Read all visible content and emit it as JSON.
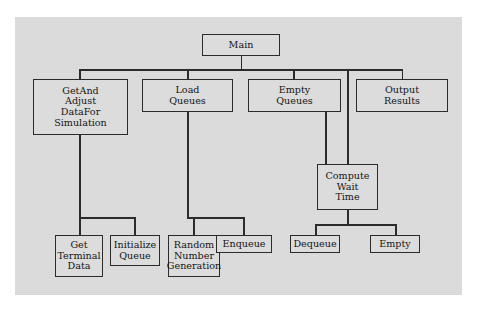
{
  "diagram": {
    "type": "structure-chart",
    "background_color": "#dcdcdc",
    "page_color": "#ffffff",
    "line_color": "#2b2b2b",
    "text_color": "#141414",
    "nodes": [
      {
        "id": "main",
        "lines": [
          "Main"
        ]
      },
      {
        "id": "getandadjust",
        "lines": [
          "GetAnd",
          "Adjust",
          "DataFor",
          "Simulation"
        ]
      },
      {
        "id": "loadqueues",
        "lines": [
          "Load",
          "Queues"
        ]
      },
      {
        "id": "emptyqueues",
        "lines": [
          "Empty",
          "Queues"
        ]
      },
      {
        "id": "outputresults",
        "lines": [
          "Output",
          "Results"
        ]
      },
      {
        "id": "computewait",
        "lines": [
          "Compute",
          "Wait",
          "Time"
        ]
      },
      {
        "id": "getterminal",
        "lines": [
          "Get",
          "Terminal",
          "Data"
        ]
      },
      {
        "id": "initqueue",
        "lines": [
          "Initialize",
          "Queue"
        ]
      },
      {
        "id": "randomnumber",
        "lines": [
          "Random",
          "Number",
          "Generation"
        ]
      },
      {
        "id": "enqueue",
        "lines": [
          "Enqueue"
        ]
      },
      {
        "id": "dequeue",
        "lines": [
          "Dequeue"
        ]
      },
      {
        "id": "empty",
        "lines": [
          "Empty"
        ]
      }
    ],
    "edges": [
      {
        "from": "main",
        "to": "getandadjust"
      },
      {
        "from": "main",
        "to": "loadqueues"
      },
      {
        "from": "main",
        "to": "emptyqueues"
      },
      {
        "from": "main",
        "to": "outputresults"
      },
      {
        "from": "main",
        "to": "computewait"
      },
      {
        "from": "getandadjust",
        "to": "getterminal"
      },
      {
        "from": "getandadjust",
        "to": "initqueue"
      },
      {
        "from": "loadqueues",
        "to": "randomnumber"
      },
      {
        "from": "loadqueues",
        "to": "enqueue"
      },
      {
        "from": "emptyqueues",
        "to": "computewait"
      },
      {
        "from": "computewait",
        "to": "dequeue"
      },
      {
        "from": "computewait",
        "to": "empty"
      }
    ]
  }
}
